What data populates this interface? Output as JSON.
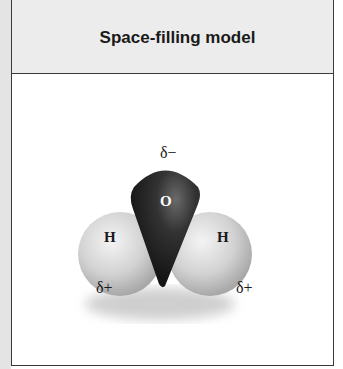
{
  "panel": {
    "title": "Space-filling model"
  },
  "molecule": {
    "name": "water",
    "atoms": [
      {
        "symbol": "O",
        "color": "#2b2b2b"
      },
      {
        "symbol": "H",
        "color": "#d6d6d6"
      },
      {
        "symbol": "H",
        "color": "#d6d6d6"
      }
    ],
    "charges": {
      "oxygen": "δ−",
      "hydrogen_left": "δ+",
      "hydrogen_right": "δ+"
    }
  }
}
